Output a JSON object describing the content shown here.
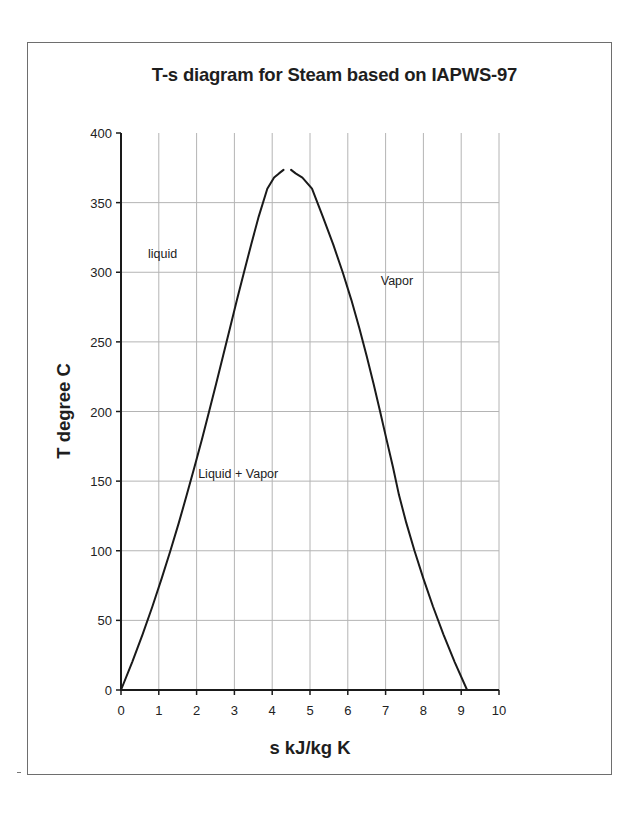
{
  "chart_data": {
    "type": "line",
    "title": "T-s diagram for Steam based on IAPWS-97",
    "title_visible": "T-s diagram for Steam based on IAPWS-9",
    "xlabel": "s kJ/kg K",
    "ylabel": "T degree C",
    "xlim": [
      0,
      10
    ],
    "ylim": [
      0,
      400
    ],
    "x_ticks": [
      0,
      1,
      2,
      3,
      4,
      5,
      6,
      7,
      8,
      9,
      10
    ],
    "y_ticks": [
      0,
      50,
      100,
      150,
      200,
      250,
      300,
      350,
      400
    ],
    "grid": true,
    "legend": null,
    "annotations": [
      {
        "text": "liquid",
        "x": 1.1,
        "y": 310
      },
      {
        "text": "Vapor",
        "x": 7.3,
        "y": 291
      },
      {
        "text": "Liquid + Vapor",
        "x": 3.1,
        "y": 152
      }
    ],
    "series": [
      {
        "name": "Saturated liquid",
        "x": [
          0.0,
          0.296,
          0.572,
          0.831,
          1.075,
          1.307,
          1.528,
          1.739,
          1.943,
          2.139,
          2.331,
          2.518,
          2.702,
          2.884,
          3.067,
          3.253,
          3.445,
          3.643,
          3.87,
          4.05,
          4.18,
          4.3
        ],
        "y": [
          0.01,
          20,
          40,
          60,
          80,
          100,
          120,
          140,
          160,
          180,
          200,
          220,
          240,
          260,
          280,
          300,
          320,
          340,
          360,
          368,
          371,
          373.5
        ]
      },
      {
        "name": "Saturated vapor",
        "x": [
          4.5,
          4.62,
          4.8,
          5.053,
          5.339,
          5.614,
          5.865,
          6.094,
          6.303,
          6.497,
          6.679,
          6.854,
          7.025,
          7.196,
          7.354,
          7.547,
          7.764,
          8.0,
          8.255,
          8.529,
          8.827,
          9.156
        ],
        "y": [
          373.5,
          371,
          368,
          360,
          340,
          320,
          300,
          280,
          260,
          240,
          220,
          200,
          180,
          160,
          140,
          120,
          100,
          80,
          60,
          40,
          20,
          0.01
        ]
      }
    ]
  },
  "footer_mark": "-"
}
